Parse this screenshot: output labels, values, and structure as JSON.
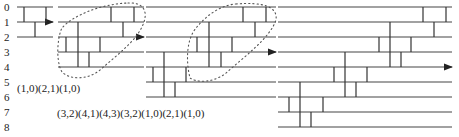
{
  "figure": {
    "type": "sorting network / ladder diagram",
    "row_labels": [
      "0",
      "1",
      "2",
      "3",
      "4",
      "5",
      "6",
      "7",
      "8"
    ],
    "sequences": {
      "first": "(1,0)(2,1)(1,0)",
      "second": "(3,2)(4,1)(4,3)(3,2)(1,0)(2,1)(1,0)"
    },
    "panels": [
      {
        "name": "panel-1",
        "wires": [
          0,
          1,
          2
        ],
        "rungs_between": [
          [
            0,
            1
          ],
          [
            1,
            2
          ],
          [
            0,
            1
          ]
        ],
        "arrow_row": 1
      },
      {
        "name": "panel-2",
        "wires": [
          0,
          1,
          2,
          3,
          4
        ],
        "arrow_row": 2,
        "lasso": true
      },
      {
        "name": "panel-3",
        "wires": [
          0,
          1,
          2,
          3,
          4,
          5,
          6
        ],
        "arrow_row": 3,
        "lasso": true
      },
      {
        "name": "panel-4",
        "wires": [
          0,
          1,
          2,
          3,
          4,
          5,
          6,
          7,
          8
        ],
        "arrow_row": 4
      }
    ]
  }
}
